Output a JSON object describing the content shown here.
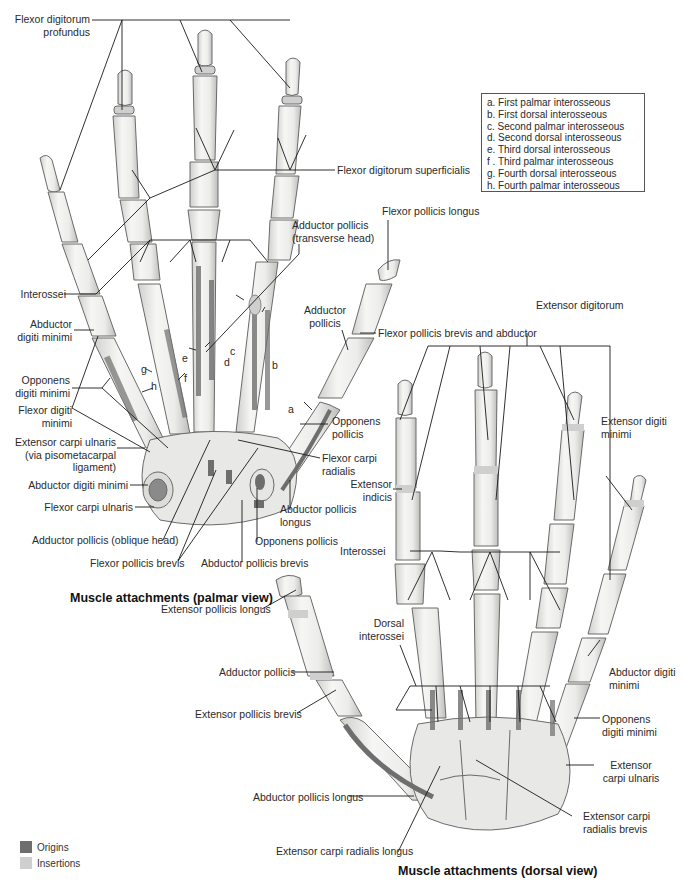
{
  "figure": {
    "palmar_title": "Muscle attachments (palmar view)",
    "dorsal_title": "Muscle attachments (dorsal view)"
  },
  "key": {
    "items": [
      "a. First palmar interosseous",
      "b. First dorsal interosseous",
      "c. Second palmar interosseous",
      "d. Second dorsal interosseous",
      "e. Third dorsal interosseous",
      "f . Third palmar interosseous",
      "g. Fourth dorsal interosseous",
      "h. Fourth palmar interosseous"
    ]
  },
  "legend": {
    "items": [
      {
        "label": "Origins",
        "color": "#6e6e6e"
      },
      {
        "label": "Insertions",
        "color": "#cfcfcf"
      }
    ]
  },
  "palmar_labels": {
    "fdp_1": "Flexor digitorum",
    "fdp_2": "profundus",
    "fds": "Flexor digitorum superficialis",
    "fpl": "Flexor pollicis longus",
    "add_trans_1": "Adductor pollicis",
    "add_trans_2": "(transverse head)",
    "interossei": "Interossei",
    "abd_dm_1": "Abductor",
    "abd_dm_2": "digiti minimi",
    "add_pol_1": "Adductor",
    "add_pol_2": "pollicis",
    "fpb_abd": "Flexor pollicis brevis and abductor",
    "opp_dm_1": "Opponens",
    "opp_dm_2": "digiti minimi",
    "fdm_1": "Flexor digiti",
    "fdm_2": "minimi",
    "ecu_1": "Extensor carpi ulnaris",
    "ecu_2": "(via pisometacarpal",
    "ecu_3": "ligament)",
    "opp_pol_1": "Opponens",
    "opp_pol_2": "pollicis",
    "fcr_1": "Flexor carpi",
    "fcr_2": "radialis",
    "abd_dm_wrist": "Abductor digiti minimi",
    "fcu": "Flexor carpi ulnaris",
    "apl_1": "Abductor pollicis",
    "apl_2": "longus",
    "add_obl": "Adductor pollicis (oblique head)",
    "opp_pol_wrist": "Opponens pollicis",
    "fpb": "Flexor pollicis brevis",
    "apb": "Abductor pollicis brevis",
    "letters": {
      "a": "a",
      "b": "b",
      "c": "c",
      "d": "d",
      "e": "e",
      "f": "f",
      "g": "g",
      "h": "h"
    }
  },
  "dorsal_labels": {
    "ed": "Extensor digitorum",
    "edm_1": "Extensor digiti",
    "edm_2": "minimi",
    "ei_1": "Extensor",
    "ei_2": "indicis",
    "interossei": "Interossei",
    "epl": "Extensor pollicis longus",
    "dorsal_int_1": "Dorsal",
    "dorsal_int_2": "interossei",
    "add_pol": "Adductor pollicis",
    "epb": "Extensor pollicis brevis",
    "abd_dm_1": "Abductor digiti",
    "abd_dm_2": "minimi",
    "opp_dm_1": "Opponens",
    "opp_dm_2": "digiti minimi",
    "ecu_1": "Extensor",
    "ecu_2": "carpi ulnaris",
    "apl": "Abductor pollicis longus",
    "ecrb_1": "Extensor carpi",
    "ecrb_2": "radialis brevis",
    "ecrl": "Extensor carpi radialis longus"
  },
  "colors": {
    "bone_fill": "#ededeb",
    "bone_stroke": "#6a6a6a",
    "origin": "#6e6e6e",
    "insertion": "#cfcfcf",
    "leader": "#1a1a1a"
  }
}
